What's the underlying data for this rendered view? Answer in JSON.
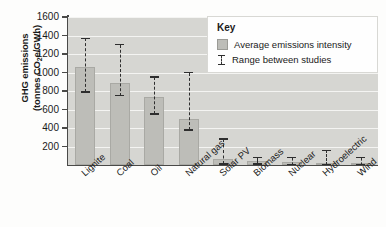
{
  "chart_data": {
    "type": "bar",
    "title": "",
    "xlabel": "",
    "ylabel_line1": "GHG emissions",
    "ylabel_line2": "(tonnes CO e/GWh)",
    "ylabel_sub": "2",
    "ylim": [
      0,
      1600
    ],
    "yticks": [
      200,
      400,
      600,
      800,
      1000,
      1200,
      1400,
      1600
    ],
    "grid": "horizontal",
    "legend_position": "top-right-inside",
    "categories": [
      "Lignite",
      "Coal",
      "Oil",
      "Natural gas",
      "Solar PV",
      "Biomass",
      "Nuclear",
      "Hydroelectric",
      "Wind"
    ],
    "series": [
      {
        "name": "Average emissions intensity",
        "values": [
          1060,
          890,
          740,
          500,
          70,
          40,
          30,
          25,
          20
        ]
      }
    ],
    "ranges": [
      {
        "category": "Lignite",
        "low": 790,
        "high": 1370
      },
      {
        "category": "Coal",
        "low": 750,
        "high": 1300
      },
      {
        "category": "Oil",
        "low": 550,
        "high": 950
      },
      {
        "category": "Natural gas",
        "low": 380,
        "high": 1000
      },
      {
        "category": "Solar PV",
        "low": 10,
        "high": 280
      },
      {
        "category": "Biomass",
        "low": 10,
        "high": 80
      },
      {
        "category": "Nuclear",
        "low": 5,
        "high": 80
      },
      {
        "category": "Hydroelectric",
        "low": 5,
        "high": 160
      },
      {
        "category": "Wind",
        "low": 5,
        "high": 80
      }
    ],
    "colors": {
      "bar_fill": "#bdbdb8",
      "bar_stroke": "#a9a9a4",
      "plot_background": "#d6d6d2",
      "gridline": "#f4f4f2",
      "axis": "#4a4a48",
      "error_bar": "#2e2e2e"
    }
  },
  "legend": {
    "title": "Key",
    "entries": [
      {
        "label": "Average emissions intensity",
        "marker": "swatch"
      },
      {
        "label": "Range between studies",
        "marker": "errorbar"
      }
    ]
  }
}
